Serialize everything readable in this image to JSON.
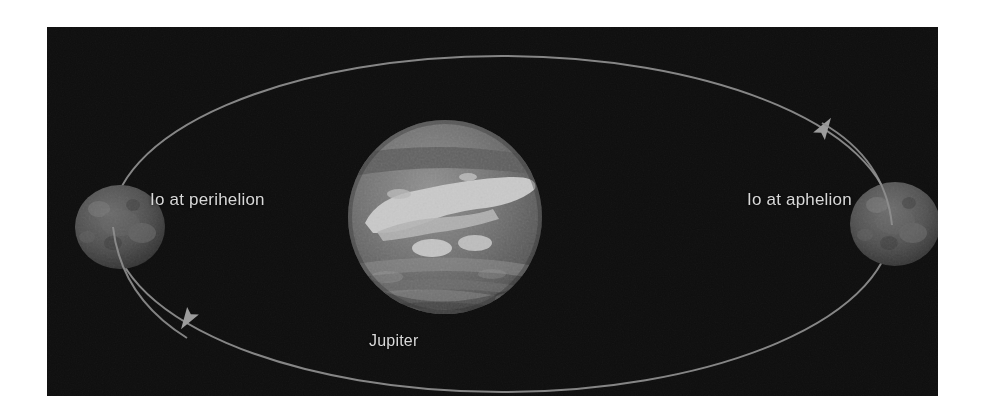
{
  "figure": {
    "background_color": "#ffffff",
    "panel_color": "#0d0d0d",
    "label_color": "#d8d8d8",
    "orbit_color": "#8c8c8c"
  },
  "labels": {
    "perihelion": "Io at perihelion",
    "aphelion": "Io at aphelion",
    "jupiter": "Jupiter"
  },
  "bodies": [
    {
      "name": "Io at perihelion",
      "kind": "moon",
      "cx": 73,
      "cy": 200,
      "rx": 45,
      "ry": 42,
      "fill": "#4a4a4a"
    },
    {
      "name": "Jupiter",
      "kind": "planet",
      "cx": 398,
      "cy": 190,
      "rx": 97,
      "ry": 97,
      "fill": "#6e6e6e"
    },
    {
      "name": "Io at aphelion",
      "kind": "moon",
      "cx": 848,
      "cy": 197,
      "rx": 45,
      "ry": 42,
      "fill": "#4a4a4a"
    }
  ],
  "orbit": {
    "shape": "ellipse",
    "cx": 455,
    "cy": 197,
    "rx": 390,
    "ry": 168,
    "stroke": "#8e8e8e",
    "stroke_width": 2,
    "direction": "clockwise",
    "arrow_markers": [
      {
        "name": "orbit-arrow-upper-right",
        "x": 778,
        "y": 100,
        "angle": -58
      },
      {
        "name": "orbit-arrow-lower-left",
        "x": 140,
        "y": 293,
        "angle": 122
      }
    ]
  }
}
